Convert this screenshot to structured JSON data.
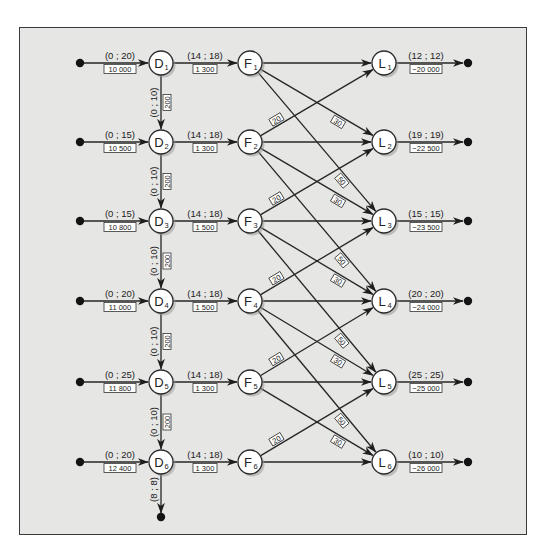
{
  "colors": {
    "background": "#e6e6e4",
    "frame": "#3a3a3a",
    "line": "#262626",
    "node_fill": "#ffffff"
  },
  "rows_y": [
    63,
    142,
    221,
    301,
    382,
    462
  ],
  "columns_x": {
    "source": 80,
    "D": 161,
    "F": 250,
    "L": 384,
    "sink": 468
  },
  "node_radius": 12,
  "nodes": {
    "D": [
      {
        "id": "D1",
        "letter": "D",
        "sub": "1"
      },
      {
        "id": "D2",
        "letter": "D",
        "sub": "2"
      },
      {
        "id": "D3",
        "letter": "D",
        "sub": "3"
      },
      {
        "id": "D4",
        "letter": "D",
        "sub": "4"
      },
      {
        "id": "D5",
        "letter": "D",
        "sub": "5"
      },
      {
        "id": "D6",
        "letter": "D",
        "sub": "6"
      }
    ],
    "F": [
      {
        "id": "F1",
        "letter": "F",
        "sub": "1"
      },
      {
        "id": "F2",
        "letter": "F",
        "sub": "2"
      },
      {
        "id": "F3",
        "letter": "F",
        "sub": "3"
      },
      {
        "id": "F4",
        "letter": "F",
        "sub": "4"
      },
      {
        "id": "F5",
        "letter": "F",
        "sub": "5"
      },
      {
        "id": "F6",
        "letter": "F",
        "sub": "6"
      }
    ],
    "L": [
      {
        "id": "L1",
        "letter": "L",
        "sub": "1"
      },
      {
        "id": "L2",
        "letter": "L",
        "sub": "2"
      },
      {
        "id": "L3",
        "letter": "L",
        "sub": "3"
      },
      {
        "id": "L4",
        "letter": "L",
        "sub": "4"
      },
      {
        "id": "L5",
        "letter": "L",
        "sub": "5"
      },
      {
        "id": "L6",
        "letter": "L",
        "sub": "6"
      }
    ]
  },
  "supply_arcs": [
    {
      "to": "D1",
      "bounds": "(0 ; 20)",
      "cost": "10 000"
    },
    {
      "to": "D2",
      "bounds": "(0 ; 15)",
      "cost": "10 500"
    },
    {
      "to": "D3",
      "bounds": "(0 ; 15)",
      "cost": "10 800"
    },
    {
      "to": "D4",
      "bounds": "(0 ; 20)",
      "cost": "11 000"
    },
    {
      "to": "D5",
      "bounds": "(0 ; 25)",
      "cost": "11 800"
    },
    {
      "to": "D6",
      "bounds": "(0 ; 20)",
      "cost": "12 400"
    }
  ],
  "inventory_arcs": [
    {
      "from": "D1",
      "to": "D2",
      "bounds": "(0 ; 10)",
      "cost": "200"
    },
    {
      "from": "D2",
      "to": "D3",
      "bounds": "(0 ; 10)",
      "cost": "200"
    },
    {
      "from": "D3",
      "to": "D4",
      "bounds": "(0 ; 10)",
      "cost": "200"
    },
    {
      "from": "D4",
      "to": "D5",
      "bounds": "(0 ; 10)",
      "cost": "200"
    },
    {
      "from": "D5",
      "to": "D6",
      "bounds": "(0 ; 10)",
      "cost": "200"
    }
  ],
  "final_inventory_arc": {
    "from": "D6",
    "bounds": "(8 ; 8)",
    "end_y": 517
  },
  "production_arcs": [
    {
      "from": "D1",
      "to": "F1",
      "bounds": "(14 ; 18)",
      "cost": "1 300"
    },
    {
      "from": "D2",
      "to": "F2",
      "bounds": "(14 ; 18)",
      "cost": "1 300"
    },
    {
      "from": "D3",
      "to": "F3",
      "bounds": "(14 ; 18)",
      "cost": "1 500"
    },
    {
      "from": "D4",
      "to": "F4",
      "bounds": "(14 ; 18)",
      "cost": "1 500"
    },
    {
      "from": "D5",
      "to": "F5",
      "bounds": "(14 ; 18)",
      "cost": "1 300"
    },
    {
      "from": "D6",
      "to": "F6",
      "bounds": "(14 ; 18)",
      "cost": "1 300"
    }
  ],
  "delivery_arcs": [
    {
      "from": 1,
      "to": 1,
      "cost": ""
    },
    {
      "from": 1,
      "to": 2,
      "cost": "30"
    },
    {
      "from": 1,
      "to": 3,
      "cost": "50"
    },
    {
      "from": 2,
      "to": 1,
      "cost": "20"
    },
    {
      "from": 2,
      "to": 2,
      "cost": ""
    },
    {
      "from": 2,
      "to": 3,
      "cost": "30"
    },
    {
      "from": 2,
      "to": 4,
      "cost": "50"
    },
    {
      "from": 3,
      "to": 2,
      "cost": "20"
    },
    {
      "from": 3,
      "to": 3,
      "cost": ""
    },
    {
      "from": 3,
      "to": 4,
      "cost": "30"
    },
    {
      "from": 3,
      "to": 5,
      "cost": "50"
    },
    {
      "from": 4,
      "to": 3,
      "cost": "20"
    },
    {
      "from": 4,
      "to": 4,
      "cost": ""
    },
    {
      "from": 4,
      "to": 5,
      "cost": "30"
    },
    {
      "from": 4,
      "to": 6,
      "cost": "50"
    },
    {
      "from": 5,
      "to": 4,
      "cost": "20"
    },
    {
      "from": 5,
      "to": 5,
      "cost": ""
    },
    {
      "from": 5,
      "to": 6,
      "cost": "30"
    },
    {
      "from": 6,
      "to": 5,
      "cost": "20"
    },
    {
      "from": 6,
      "to": 6,
      "cost": ""
    }
  ],
  "demand_arcs": [
    {
      "from": "L1",
      "bounds": "(12 ; 12)",
      "cost": "−20 000"
    },
    {
      "from": "L2",
      "bounds": "(19 ; 19)",
      "cost": "−22 500"
    },
    {
      "from": "L3",
      "bounds": "(15 ; 15)",
      "cost": "−23 500"
    },
    {
      "from": "L4",
      "bounds": "(20 ; 20)",
      "cost": "−24 000"
    },
    {
      "from": "L5",
      "bounds": "(25 ; 25)",
      "cost": "−25 000"
    },
    {
      "from": "L6",
      "bounds": "(10 ; 10)",
      "cost": "−26 000"
    }
  ]
}
